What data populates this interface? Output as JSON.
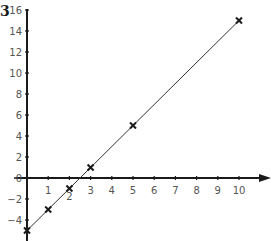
{
  "question_number": "3",
  "chart_data": {
    "type": "scatter",
    "title": "",
    "xlabel": "",
    "ylabel": "",
    "xlim": [
      0,
      11.5
    ],
    "ylim": [
      -6,
      16
    ],
    "grid": false,
    "x_ticks": [
      1,
      2,
      3,
      4,
      5,
      6,
      7,
      8,
      9,
      10
    ],
    "y_ticks": [
      -4,
      -2,
      0,
      2,
      4,
      6,
      8,
      10,
      12,
      14,
      16
    ],
    "x_tick_labels": [
      "1",
      "2",
      "3",
      "4",
      "5",
      "6",
      "7",
      "8",
      "9",
      "10"
    ],
    "y_tick_labels": [
      "-4",
      "-2",
      "0",
      "2",
      "4",
      "6",
      "8",
      "10",
      "12",
      "14",
      "16"
    ],
    "series": [
      {
        "name": "points",
        "marker": "x",
        "x": [
          0,
          1,
          2,
          3,
          5,
          10
        ],
        "y": [
          -5,
          -3,
          -1,
          1,
          5,
          15
        ]
      }
    ],
    "line": {
      "equation": "y = 2x - 5",
      "x_range": [
        0,
        10
      ]
    },
    "colors": {
      "axis": "#1a1a1a",
      "line": "#333333",
      "marker": "#1a1a1a",
      "label": "#555555"
    }
  }
}
